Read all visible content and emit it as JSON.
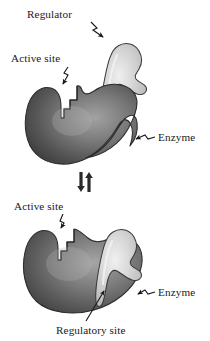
{
  "figure": {
    "width": 210,
    "height": 341
  },
  "colors": {
    "background": "#ffffff",
    "enzyme_dark": "#4a4a4a",
    "enzyme_mid": "#6e6e6e",
    "enzyme_light": "#9a9a9a",
    "enzyme_outline": "#2b2b2b",
    "regulator_light": "#dcdcdc",
    "regulator_mid": "#c2c2c2",
    "regulator_outline": "#3a3a3a",
    "text": "#1a1a1a",
    "arrow": "#1a1a1a"
  },
  "panels": {
    "top": {
      "name": "unbound-state",
      "labels": {
        "regulator": "Regulator",
        "active_site": "Active site",
        "enzyme": "Enzyme"
      }
    },
    "bottom": {
      "name": "bound-state",
      "labels": {
        "active_site": "Active site",
        "enzyme": "Enzyme",
        "regulatory_site": "Regulatory site"
      }
    }
  },
  "equilibrium": {
    "symbol": "⇅",
    "description": "reversible equilibrium between unbound and regulator-bound enzyme"
  }
}
